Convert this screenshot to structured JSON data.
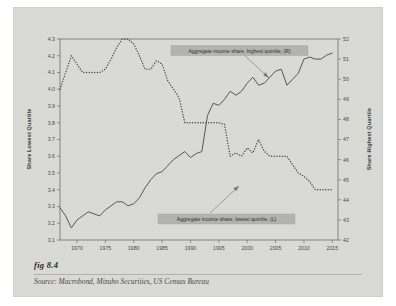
{
  "figure": {
    "label": "fig 8.4",
    "source_label": "Source:",
    "source_text": "Macrobond, Mizuho Securities, US Census Bureau"
  },
  "chart_data": {
    "type": "line",
    "title": "",
    "xlabel": "",
    "grid": false,
    "legend_position": "inline-annotations",
    "xlim": [
      1967,
      2016
    ],
    "xticks": [
      1970,
      1975,
      1980,
      1985,
      1990,
      1995,
      2000,
      2005,
      2010,
      2015
    ],
    "xtick_labels": [
      "1970",
      "1975",
      "1980",
      "1985",
      "1990",
      "1995",
      "2000",
      "2005",
      "2010",
      "2015"
    ],
    "left_axis": {
      "title": "Share Lowest Quartile",
      "ylim": [
        3.1,
        4.3
      ],
      "yticks": [
        3.1,
        3.2,
        3.3,
        3.4,
        3.5,
        3.6,
        3.7,
        3.8,
        3.9,
        4.0,
        4.1,
        4.2,
        4.3
      ],
      "ytick_labels": [
        "3.1",
        "3.2",
        "3.3",
        "3.4",
        "3.5",
        "3.6",
        "3.7",
        "3.8",
        "3.9",
        "4.0",
        "4.1",
        "4.2",
        "4.3"
      ]
    },
    "right_axis": {
      "title": "Share Highest Quartile",
      "ylim": [
        42,
        52
      ],
      "yticks": [
        42,
        43,
        44,
        45,
        46,
        47,
        48,
        49,
        50,
        51,
        52
      ],
      "ytick_labels": [
        "42",
        "43",
        "44",
        "45",
        "46",
        "47",
        "48",
        "49",
        "50",
        "51",
        "52"
      ]
    },
    "series": [
      {
        "name": "Aggregate income share, lowest quintile, (L)",
        "axis": "left",
        "style": "dotted",
        "color": "#4f4f52",
        "x": [
          1967,
          1968,
          1969,
          1970,
          1971,
          1972,
          1973,
          1974,
          1975,
          1976,
          1977,
          1978,
          1979,
          1980,
          1981,
          1982,
          1983,
          1984,
          1985,
          1986,
          1987,
          1988,
          1989,
          1990,
          1991,
          1992,
          1993,
          1994,
          1995,
          1996,
          1997,
          1998,
          1999,
          2000,
          2001,
          2002,
          2003,
          2004,
          2005,
          2006,
          2007,
          2008,
          2009,
          2010,
          2011,
          2012,
          2013,
          2014,
          2015
        ],
        "values": [
          4.0,
          4.1,
          4.2,
          4.15,
          4.1,
          4.1,
          4.1,
          4.1,
          4.12,
          4.18,
          4.25,
          4.3,
          4.3,
          4.27,
          4.2,
          4.12,
          4.12,
          4.17,
          4.15,
          4.05,
          4.0,
          3.95,
          3.8,
          3.8,
          3.8,
          3.8,
          3.8,
          3.8,
          3.8,
          3.79,
          3.6,
          3.62,
          3.6,
          3.65,
          3.62,
          3.7,
          3.63,
          3.6,
          3.6,
          3.6,
          3.6,
          3.55,
          3.5,
          3.48,
          3.45,
          3.4,
          3.4,
          3.4,
          3.4
        ],
        "note": "dotted; continues falling after 2009 to ~3.1 by 2015"
      },
      {
        "name": "Aggregate income share, highest quintile, (R)",
        "axis": "right",
        "style": "solid",
        "color": "#57575a",
        "x": [
          1967,
          1968,
          1969,
          1970,
          1971,
          1972,
          1973,
          1974,
          1975,
          1976,
          1977,
          1978,
          1979,
          1980,
          1981,
          1982,
          1983,
          1984,
          1985,
          1986,
          1987,
          1988,
          1989,
          1990,
          1991,
          1992,
          1993,
          1994,
          1995,
          1996,
          1997,
          1998,
          1999,
          2000,
          2001,
          2002,
          2003,
          2004,
          2005,
          2006,
          2007,
          2008,
          2009,
          2010,
          2011,
          2012,
          2013,
          2014,
          2015
        ],
        "values": [
          43.6,
          43.2,
          42.6,
          43.0,
          43.2,
          43.4,
          43.3,
          43.2,
          43.5,
          43.7,
          43.9,
          43.9,
          43.7,
          43.8,
          44.1,
          44.6,
          45.0,
          45.3,
          45.4,
          45.7,
          46.0,
          46.2,
          46.4,
          46.1,
          46.3,
          46.4,
          48.2,
          48.8,
          48.7,
          49.0,
          49.4,
          49.2,
          49.4,
          49.8,
          50.1,
          49.7,
          49.8,
          50.1,
          50.4,
          50.5,
          49.7,
          50.0,
          50.3,
          51.0,
          51.1,
          51.0,
          51.0,
          51.2,
          51.3
        ]
      }
    ],
    "annotations": [
      {
        "name": "annotation-highest-quintile",
        "text": "Aggregate income share, highest quintile, (R)",
        "points_to": "series-highest-quintile"
      },
      {
        "name": "annotation-lowest-quintile",
        "text": "Aggregate income share, lowest quintile, (L)",
        "points_to": "series-lowest-quintile"
      }
    ]
  }
}
